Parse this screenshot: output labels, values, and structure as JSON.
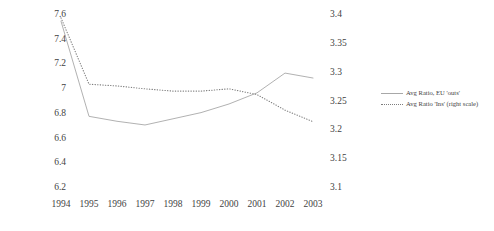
{
  "chart_data": {
    "type": "line",
    "title": "",
    "subtitle": "",
    "xlabel": "",
    "ylabel": "",
    "grid": false,
    "legend_position": "right",
    "categories": [
      "1994",
      "1995",
      "1996",
      "1997",
      "1998",
      "1999",
      "2000",
      "2001",
      "2002",
      "2003"
    ],
    "axes": {
      "left": {
        "ticks": [
          "7.6",
          "7.4",
          "7.2",
          "7",
          "6.8",
          "6.6",
          "6.4",
          "6.2"
        ],
        "values": [
          7.6,
          7.4,
          7.2,
          7.0,
          6.8,
          6.6,
          6.4,
          6.2
        ],
        "ylim": [
          6.2,
          7.6
        ]
      },
      "right": {
        "ticks": [
          "3.4",
          "3.35",
          "3.3",
          "3.25",
          "3.2",
          "3.15",
          "3.1"
        ],
        "values": [
          3.4,
          3.35,
          3.3,
          3.25,
          3.2,
          3.15,
          3.1
        ],
        "ylim": [
          3.1,
          3.4
        ]
      }
    },
    "series": [
      {
        "name": "Avg Ratio, EU 'outs'",
        "axis": "left",
        "style": "solid",
        "color": "#a8a8a8",
        "values": [
          7.55,
          6.78,
          6.74,
          6.71,
          6.76,
          6.81,
          6.88,
          6.97,
          7.13,
          7.09
        ]
      },
      {
        "name": "Avg Ratio 'Ins' (right scale)",
        "axis": "right",
        "style": "dotted",
        "color": "#7d7d7d",
        "values": [
          3.395,
          3.28,
          3.277,
          3.272,
          3.268,
          3.268,
          3.272,
          3.262,
          3.235,
          3.215
        ]
      }
    ]
  },
  "legend": {
    "items": [
      {
        "label": "Avg Ratio, EU 'outs'",
        "style": "solid"
      },
      {
        "label": "Avg Ratio 'Ins' (right scale)",
        "style": "dotted"
      }
    ]
  }
}
